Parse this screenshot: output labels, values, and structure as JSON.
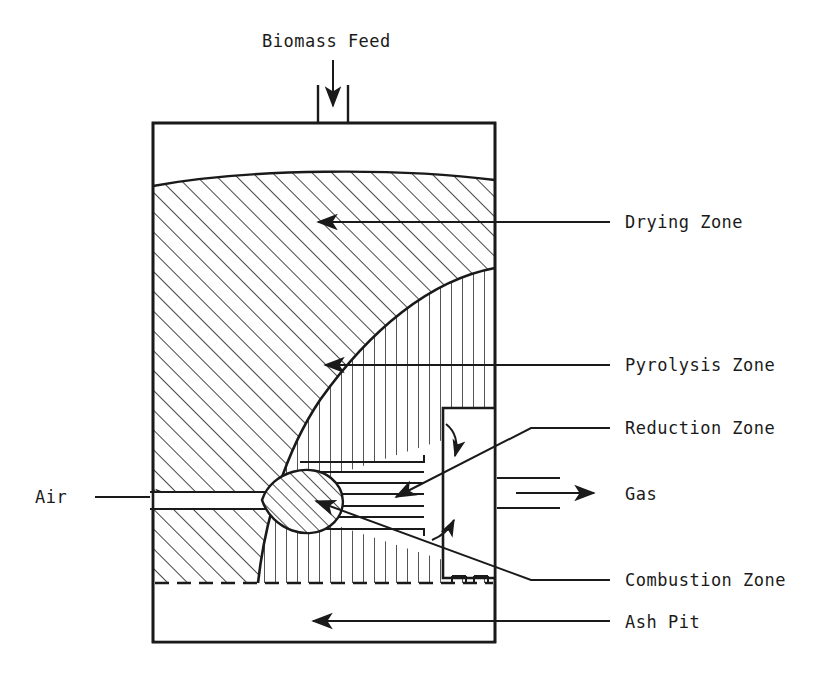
{
  "diagram": {
    "title_caption": "",
    "type": "downdraft-biomass-gasifier-cross-section",
    "colors": {
      "line": "#1a1a1a",
      "text": "#1a1a1a",
      "background": "#ffffff"
    },
    "labels": {
      "biomass_feed": "Biomass Feed",
      "drying_zone": "Drying Zone",
      "pyrolysis_zone": "Pyrolysis Zone",
      "reduction_zone": "Reduction Zone",
      "combustion_zone": "Combustion Zone",
      "ash_pit": "Ash Pit",
      "air": "Air",
      "gas": "Gas"
    },
    "zones": [
      {
        "id": "drying",
        "name": "Drying Zone",
        "hatch": "diagonal",
        "label_x": 625,
        "label_y": 228
      },
      {
        "id": "pyrolysis",
        "name": "Pyrolysis Zone",
        "hatch": "vertical",
        "label_x": 625,
        "label_y": 371
      },
      {
        "id": "reduction",
        "name": "Reduction Zone",
        "hatch": "none",
        "label_x": 625,
        "label_y": 434
      },
      {
        "id": "combustion",
        "name": "Combustion Zone",
        "hatch": "diagonal",
        "label_x": 625,
        "label_y": 586
      },
      {
        "id": "ash_pit",
        "name": "Ash Pit",
        "hatch": "none",
        "label_x": 625,
        "label_y": 628
      }
    ],
    "streams": [
      {
        "id": "biomass-feed",
        "name": "Biomass Feed",
        "direction": "down",
        "location": "top"
      },
      {
        "id": "air-inlet",
        "name": "Air",
        "direction": "right",
        "location": "left"
      },
      {
        "id": "gas-outlet",
        "name": "Gas",
        "direction": "right",
        "location": "right"
      }
    ]
  }
}
